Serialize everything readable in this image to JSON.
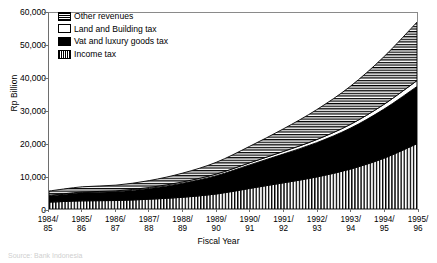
{
  "axes": {
    "ylabel": "Rp Billion",
    "xlabel": "Fiscal Year",
    "yticks": [
      "0",
      "10,000",
      "20,000",
      "30,000",
      "40,000",
      "50,000",
      "60,000"
    ],
    "ymin": 0,
    "ymax": 60000
  },
  "legend": {
    "items": [
      {
        "label": "Other revenues",
        "pattern": "horizontal-hatch",
        "color": "#000000"
      },
      {
        "label": "Land and Building tax",
        "pattern": "solid-white",
        "color": "#ffffff"
      },
      {
        "label": "Vat and luxury goods tax",
        "pattern": "solid-black",
        "color": "#000000"
      },
      {
        "label": "Income tax",
        "pattern": "vertical-hatch",
        "color": "#000000"
      }
    ]
  },
  "source_note": "Source: Bank Indonesia",
  "chart_data": {
    "type": "area",
    "title": "",
    "subtitle": "",
    "xlabel": "Fiscal Year",
    "ylabel": "Rp Billion",
    "ylim": [
      0,
      60000
    ],
    "yticks": [
      0,
      10000,
      20000,
      30000,
      40000,
      50000,
      60000
    ],
    "grid": false,
    "stacked": true,
    "legend_position": "top-left-inside",
    "categories": [
      "1984/\n85",
      "1985/\n86",
      "1986/\n87",
      "1987/\n88",
      "1988/\n89",
      "1989/\n90",
      "1990/\n91",
      "1991/\n92",
      "1992/\n93",
      "1993/\n94",
      "1994/\n95",
      "1995/\n96"
    ],
    "categories_line1": [
      "1984/",
      "1985/",
      "1986/",
      "1987/",
      "1988/",
      "1989/",
      "1990/",
      "1991/",
      "1992/",
      "1993/",
      "1994/",
      "1995/"
    ],
    "categories_line2": [
      "85",
      "86",
      "87",
      "88",
      "89",
      "90",
      "91",
      "92",
      "93",
      "94",
      "95",
      "96"
    ],
    "series": [
      {
        "name": "Income tax",
        "pattern": "vertical-hatch",
        "stack_order": 1,
        "values": [
          2100,
          2500,
          2600,
          3000,
          3600,
          4600,
          6300,
          8000,
          9800,
          12200,
          15500,
          20000
        ]
      },
      {
        "name": "Vat and luxury goods tax",
        "pattern": "solid-black",
        "stack_order": 2,
        "values": [
          1900,
          2500,
          2700,
          3300,
          4300,
          5600,
          7200,
          8800,
          10500,
          12500,
          15000,
          17500
        ]
      },
      {
        "name": "Land and Building tax",
        "pattern": "solid-white",
        "stack_order": 3,
        "values": [
          150,
          200,
          250,
          300,
          400,
          500,
          650,
          800,
          950,
          1150,
          1450,
          1800
        ]
      },
      {
        "name": "Other revenues",
        "pattern": "horizontal-hatch",
        "stack_order": 4,
        "values": [
          1350,
          1600,
          1750,
          2100,
          2700,
          3600,
          5050,
          6900,
          9150,
          11650,
          14550,
          17900
        ]
      }
    ],
    "totals": [
      5500,
      6800,
      7300,
      8700,
      11000,
      14300,
      19200,
      24500,
      30400,
      37500,
      46500,
      57200
    ]
  }
}
